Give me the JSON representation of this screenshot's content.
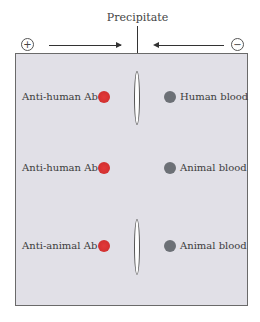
{
  "diagram": {
    "title": "Precipitate",
    "anode_symbol": "+",
    "cathode_symbol": "−",
    "colors": {
      "antibody_dot": "#d63232",
      "antigen_dot": "#6c7076",
      "gel": "#e1e0e7"
    },
    "rows": [
      {
        "left_label": "Anti-human Ab",
        "right_label": "Human blood",
        "precipitate": true
      },
      {
        "left_label": "Anti-human Ab",
        "right_label": "Animal blood",
        "precipitate": false
      },
      {
        "left_label": "Anti-animal Ab",
        "right_label": "Animal blood",
        "precipitate": true
      }
    ]
  }
}
